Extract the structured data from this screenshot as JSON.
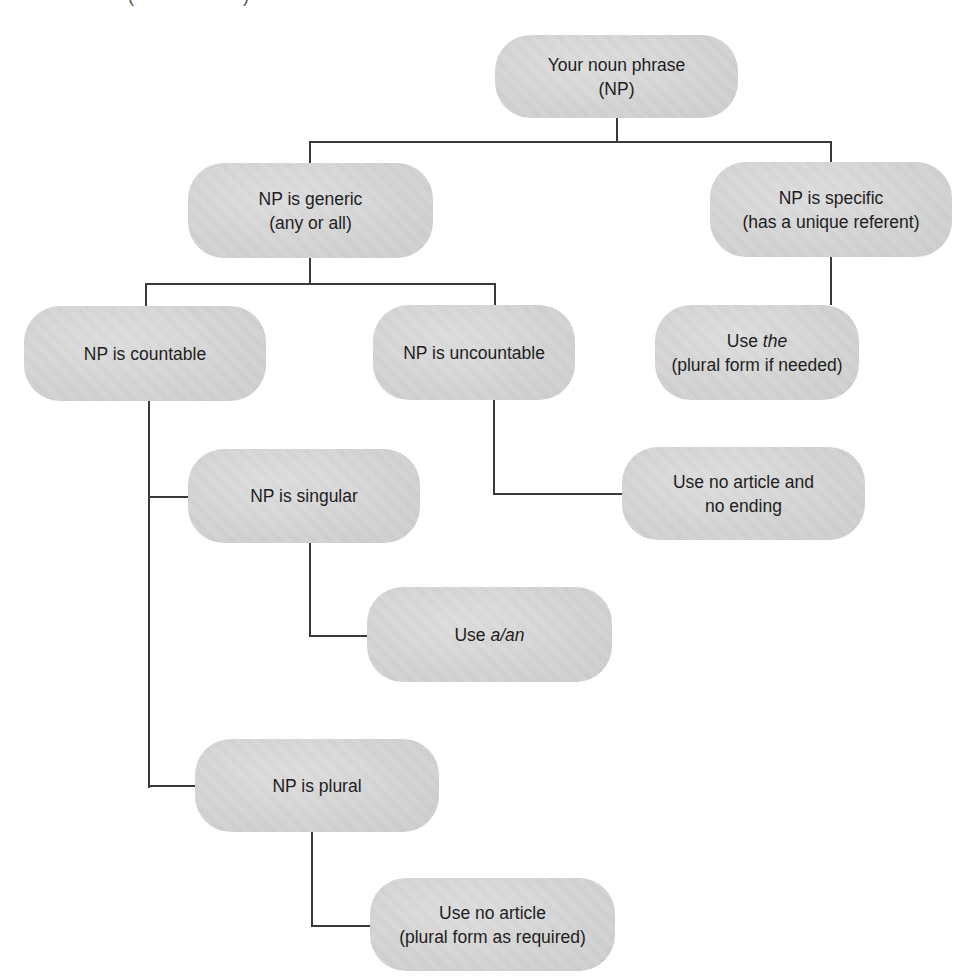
{
  "diagram": {
    "type": "decision-tree",
    "top_clipped_fragments": [
      "(",
      ")"
    ],
    "nodes": {
      "root": {
        "line1": "Your noun phrase",
        "line2": "(NP)"
      },
      "generic": {
        "line1": "NP is generic",
        "line2": "(any or all)"
      },
      "specific": {
        "line1": "NP is specific",
        "line2": "(has a unique referent)"
      },
      "countable": {
        "line1": "NP is countable"
      },
      "uncountable": {
        "line1": "NP is uncountable"
      },
      "use_the": {
        "line1_prefix": "Use ",
        "line1_italic": "the",
        "line2": "(plural form if needed)"
      },
      "no_article_no_ending": {
        "line1": "Use no article and",
        "line2": "no ending"
      },
      "singular": {
        "line1": "NP is singular"
      },
      "use_a_an": {
        "line1_prefix": "Use ",
        "line1_italic": "a/an"
      },
      "plural": {
        "line1": "NP is plural"
      },
      "no_article_plural": {
        "line1": "Use no article",
        "line2": "(plural form as required)"
      }
    },
    "edges": [
      {
        "from": "root",
        "to": "generic"
      },
      {
        "from": "root",
        "to": "specific"
      },
      {
        "from": "generic",
        "to": "countable"
      },
      {
        "from": "generic",
        "to": "uncountable"
      },
      {
        "from": "specific",
        "to": "use_the"
      },
      {
        "from": "uncountable",
        "to": "no_article_no_ending"
      },
      {
        "from": "countable",
        "to": "singular"
      },
      {
        "from": "countable",
        "to": "plural"
      },
      {
        "from": "singular",
        "to": "use_a_an"
      },
      {
        "from": "plural",
        "to": "no_article_plural"
      }
    ],
    "colors": {
      "node_fill": "#d5d5d5",
      "line": "#3a3a3a",
      "text": "#1e1e1e"
    }
  }
}
